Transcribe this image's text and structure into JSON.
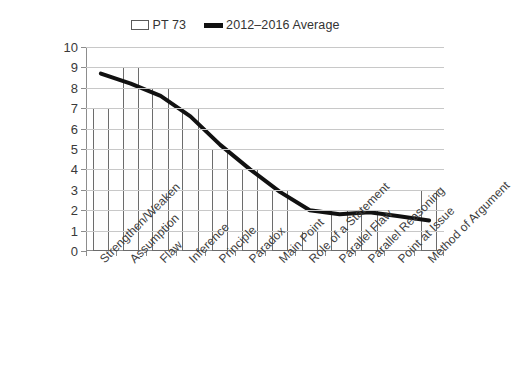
{
  "legend": {
    "items": [
      {
        "label": "PT 73",
        "type": "bar-swatch",
        "icon": "bar-swatch-icon",
        "color": "#ffffff"
      },
      {
        "label": "2012–2016 Average",
        "type": "line-swatch",
        "icon": "line-swatch-icon",
        "color": "#111111"
      }
    ]
  },
  "axes": {
    "y_ticks": [
      "0",
      "1",
      "2",
      "3",
      "4",
      "5",
      "6",
      "7",
      "8",
      "9",
      "10"
    ]
  },
  "chart_data": {
    "type": "bar",
    "title": "",
    "subtitle": "",
    "xlabel": "",
    "ylabel": "",
    "ylim": [
      0,
      10
    ],
    "ytick_step": 1,
    "grid": true,
    "legend_position": "top-center",
    "categories": [
      "Strengthen/Weaken",
      "Assumption",
      "Flaw",
      "Inference",
      "Principle",
      "Paradox",
      "Main Point",
      "Role of a Statement",
      "Parallel Flaw",
      "Parallel Reasoning",
      "Point at Issue",
      "Method of Argument"
    ],
    "series": [
      {
        "name": "PT 73",
        "type": "bar",
        "color": "#ffffff",
        "edge_color": "#6b6b6b",
        "values": [
          7,
          9,
          8,
          7,
          5,
          4,
          3,
          1,
          2,
          2,
          0,
          3
        ]
      },
      {
        "name": "2012–2016 Average",
        "type": "line",
        "color": "#111111",
        "values": [
          8.7,
          8.2,
          7.6,
          6.6,
          5.2,
          4.0,
          2.9,
          2.0,
          1.8,
          1.9,
          1.7,
          1.5
        ]
      }
    ]
  }
}
